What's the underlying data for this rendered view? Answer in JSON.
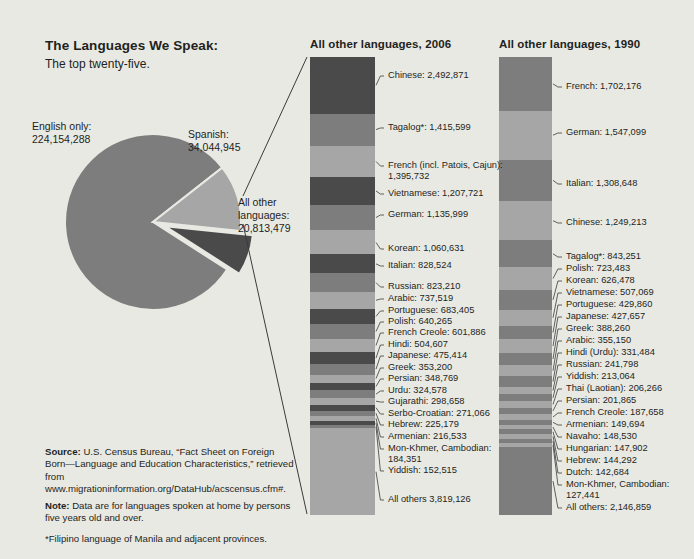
{
  "header": {
    "title": "The Languages We Speak:",
    "subtitle": "The top twenty-five."
  },
  "columns": {
    "c2006_heading": "All other languages, 2006",
    "c1990_heading": "All other languages, 1990"
  },
  "pie": {
    "english_label": "English only:\n224,154,288",
    "spanish_label": "Spanish:\n34,044,945",
    "other_label": "All other\nlanguages:\n20,813,479"
  },
  "footer": {
    "source_bold": "Source:",
    "source_text": " U.S. Census Bureau, “Fact Sheet on Foreign Born—Language and Education Characteristics,” retrieved from www.migrationinformation.org/DataHub/acscensus.cfm#.",
    "note_bold": "Note:",
    "note_text": " Data are for languages spoken at home by persons five years old and over.",
    "star_text": "*Filipino language of Manila and adjacent provinces."
  },
  "colors": {
    "background": "#e9e9e4",
    "dark": "#4a4a4a",
    "medium": "#7d7d7d",
    "light": "#a6a6a6",
    "pale": "#bdbdbd",
    "text": "#231f20",
    "leader": "#3a3a3a"
  },
  "chart_data": [
    {
      "type": "pie",
      "title": "The Languages We Speak: The top twenty-five.",
      "categories": [
        "English only",
        "Spanish",
        "All other languages"
      ],
      "values": [
        224154288,
        34044945,
        20813479
      ],
      "labels": [
        "English only: 224,154,288",
        "Spanish: 34,044,945",
        "All other languages: 20,813,479"
      ],
      "exploded": [
        "All other languages"
      ],
      "colors": [
        "#7d7d7d",
        "#a6a6a6",
        "#4a4a4a"
      ]
    },
    {
      "type": "bar",
      "orientation": "stacked-vertical",
      "title": "All other languages, 2006",
      "ylabel": "Speakers",
      "total": 20813479,
      "categories": [
        "Chinese",
        "Tagalog*",
        "French (incl. Patois, Cajun)",
        "Vietnamese",
        "German",
        "Korean",
        "Italian",
        "Russian",
        "Arabic",
        "Portuguese",
        "Polish",
        "French Creole",
        "Hindi",
        "Japanese",
        "Greek",
        "Persian",
        "Urdu",
        "Gujarathi",
        "Serbo-Croatian",
        "Hebrew",
        "Armenian",
        "Mon-Khmer, Cambodian",
        "Yiddish",
        "All others"
      ],
      "values": [
        2492871,
        1415599,
        1395732,
        1207721,
        1135999,
        1060631,
        828524,
        823210,
        737519,
        683405,
        640265,
        601886,
        504607,
        475414,
        353200,
        348769,
        324578,
        298658,
        271066,
        225179,
        216533,
        184351,
        152515,
        3819126
      ],
      "labels": [
        "Chinese: 2,492,871",
        "Tagalog*: 1,415,599",
        "French (incl. Patois, Cajun):\n1,395,732",
        "Vietnamese: 1,207,721",
        "German: 1,135,999",
        "Korean: 1,060,631",
        "Italian: 828,524",
        "Russian: 823,210",
        "Arabic: 737,519",
        "Portuguese: 683,405",
        "Polish: 640,265",
        "French Creole: 601,886",
        "Hindi: 504,607",
        "Japanese: 475,414",
        "Greek: 353,200",
        "Persian: 348,769",
        "Urdu: 324,578",
        "Gujarathi: 298,658",
        "Serbo-Croatian: 271,066",
        "Hebrew: 225,179",
        "Armenian: 216,533",
        "Mon-Khmer, Cambodian:\n184,351",
        "Yiddish: 152,515",
        "All others 3,819,126"
      ]
    },
    {
      "type": "bar",
      "orientation": "stacked-vertical",
      "title": "All other languages, 1990",
      "ylabel": "Speakers",
      "categories": [
        "French",
        "German",
        "Italian",
        "Chinese",
        "Tagalog*",
        "Polish",
        "Korean",
        "Vietnamese",
        "Portuguese",
        "Japanese",
        "Greek",
        "Arabic",
        "Hindi (Urdu)",
        "Russian",
        "Yiddish",
        "Thai (Laotian)",
        "Persian",
        "French Creole",
        "Armenian",
        "Navaho",
        "Hungarian",
        "Hebrew",
        "Dutch",
        "Mon-Khmer, Cambodian",
        "All others"
      ],
      "values": [
        1702176,
        1547099,
        1308648,
        1249213,
        843251,
        723483,
        626478,
        507069,
        429860,
        427657,
        388260,
        355150,
        331484,
        241798,
        213064,
        206266,
        201865,
        187658,
        149694,
        148530,
        147902,
        144292,
        142684,
        127441,
        2146859
      ],
      "labels": [
        "French: 1,702,176",
        "German: 1,547,099",
        "Italian: 1,308,648",
        "Chinese: 1,249,213",
        "Tagalog*: 843,251",
        "Polish: 723,483",
        "Korean: 626,478",
        "Vietnamese: 507,069",
        "Portuguese: 429,860",
        "Japanese: 427,657",
        "Greek: 388,260",
        "Arabic: 355,150",
        "Hindi (Urdu): 331,484",
        "Russian: 241,798",
        "Yiddish: 213,064",
        "Thai (Laotian): 206,266",
        "Persian: 201,865",
        "French Creole: 187,658",
        "Armenian: 149,694",
        "Navaho: 148,530",
        "Hungarian: 147,902",
        "Hebrew: 144,292",
        "Dutch: 142,684",
        "Mon-Khmer, Cambodian:\n127,441",
        "All others: 2,146,859"
      ]
    }
  ],
  "callout_layout": {
    "c2006": [
      {
        "i": 0,
        "y": 76
      },
      {
        "i": 1,
        "y": 128
      },
      {
        "i": 2,
        "y": 166
      },
      {
        "i": 3,
        "y": 194
      },
      {
        "i": 4,
        "y": 215
      },
      {
        "i": 5,
        "y": 249
      },
      {
        "i": 6,
        "y": 266
      },
      {
        "i": 7,
        "y": 287
      },
      {
        "i": 8,
        "y": 299
      },
      {
        "i": 9,
        "y": 311
      },
      {
        "i": 10,
        "y": 322
      },
      {
        "i": 11,
        "y": 333
      },
      {
        "i": 12,
        "y": 345
      },
      {
        "i": 13,
        "y": 356
      },
      {
        "i": 14,
        "y": 368
      },
      {
        "i": 15,
        "y": 379
      },
      {
        "i": 16,
        "y": 391
      },
      {
        "i": 17,
        "y": 402
      },
      {
        "i": 18,
        "y": 414
      },
      {
        "i": 19,
        "y": 425
      },
      {
        "i": 20,
        "y": 437
      },
      {
        "i": 21,
        "y": 449
      },
      {
        "i": 22,
        "y": 471
      },
      {
        "i": 23,
        "y": 500
      }
    ],
    "c1990": [
      {
        "i": 0,
        "y": 87
      },
      {
        "i": 1,
        "y": 133
      },
      {
        "i": 2,
        "y": 184
      },
      {
        "i": 3,
        "y": 223
      },
      {
        "i": 4,
        "y": 257
      },
      {
        "i": 5,
        "y": 269
      },
      {
        "i": 6,
        "y": 281
      },
      {
        "i": 7,
        "y": 293
      },
      {
        "i": 8,
        "y": 305
      },
      {
        "i": 9,
        "y": 317
      },
      {
        "i": 10,
        "y": 329
      },
      {
        "i": 11,
        "y": 341
      },
      {
        "i": 12,
        "y": 353
      },
      {
        "i": 13,
        "y": 365
      },
      {
        "i": 14,
        "y": 377
      },
      {
        "i": 15,
        "y": 389
      },
      {
        "i": 16,
        "y": 401
      },
      {
        "i": 17,
        "y": 413
      },
      {
        "i": 18,
        "y": 425
      },
      {
        "i": 19,
        "y": 437
      },
      {
        "i": 20,
        "y": 449
      },
      {
        "i": 21,
        "y": 461
      },
      {
        "i": 22,
        "y": 473
      },
      {
        "i": 23,
        "y": 485
      },
      {
        "i": 24,
        "y": 508
      }
    ]
  }
}
